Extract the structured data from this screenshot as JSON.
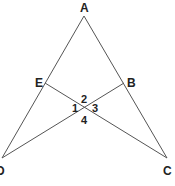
{
  "diagram": {
    "points": {
      "A": {
        "label": "A",
        "x": 84,
        "y": 16
      },
      "E": {
        "label": "E",
        "x": 45,
        "y": 83
      },
      "B": {
        "label": "B",
        "x": 124,
        "y": 83
      },
      "D": {
        "label": "D",
        "x": 2,
        "y": 158
      },
      "C": {
        "label": "C",
        "x": 167,
        "y": 158
      }
    },
    "angles": {
      "a1": "1",
      "a2": "2",
      "a3": "3",
      "a4": "4"
    },
    "line_color": "#555555"
  }
}
